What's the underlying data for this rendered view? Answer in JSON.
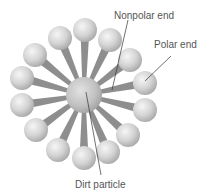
{
  "diagram": {
    "type": "micelle",
    "labels": {
      "nonpolar": "Nonpolar end",
      "polar": "Polar end",
      "dirt": "Dirt particle"
    },
    "colors": {
      "sphere_light": "#f4f4f4",
      "sphere_dark": "#a8a8a8",
      "stalk": "#8e8e8e",
      "leader": "#333333",
      "text": "#555555"
    },
    "center": {
      "x": 84,
      "y": 95,
      "r": 18
    },
    "head_radius": 12,
    "heads": [
      {
        "x": 85,
        "y": 30
      },
      {
        "x": 110,
        "y": 40
      },
      {
        "x": 130,
        "y": 60
      },
      {
        "x": 145,
        "y": 83
      },
      {
        "x": 145,
        "y": 110
      },
      {
        "x": 128,
        "y": 135
      },
      {
        "x": 108,
        "y": 152
      },
      {
        "x": 84,
        "y": 158
      },
      {
        "x": 58,
        "y": 150
      },
      {
        "x": 36,
        "y": 130
      },
      {
        "x": 22,
        "y": 105
      },
      {
        "x": 22,
        "y": 78
      },
      {
        "x": 35,
        "y": 55
      },
      {
        "x": 60,
        "y": 38
      }
    ]
  }
}
